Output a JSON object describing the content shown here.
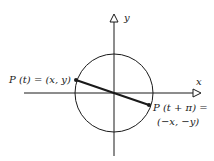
{
  "diagram": {
    "axes": {
      "x_label": "x",
      "y_label": "y"
    },
    "circle": {
      "description": "unit circle centered at origin"
    },
    "points": [
      {
        "id": "p_t",
        "label_line1": "P (t) = (x, y)"
      },
      {
        "id": "p_t_pi",
        "label_line1": "P (t + π) =",
        "label_line2": "(−x, −y)"
      }
    ],
    "colors": {
      "stroke": "#1a1a1a",
      "background": "#ffffff"
    }
  }
}
